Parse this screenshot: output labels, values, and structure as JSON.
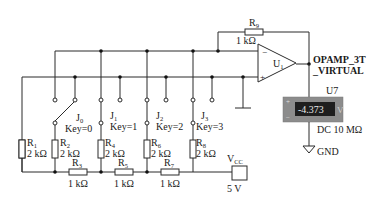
{
  "circuit": {
    "title": "4-bit R-2R ladder D/A converter with op-amp",
    "opamp": {
      "ref": "U",
      "ref_sub": "1",
      "model_line1": "OPAMP_3T",
      "model_line2": "_VIRTUAL",
      "minus": "−",
      "plus": "+"
    },
    "feedback_resistor": {
      "ref": "R",
      "ref_sub": "9",
      "value": "1 kΩ"
    },
    "resistors": [
      {
        "ref": "R",
        "sub": "1",
        "value": "2 kΩ"
      },
      {
        "ref": "R",
        "sub": "2",
        "value": "2 kΩ"
      },
      {
        "ref": "R",
        "sub": "3",
        "value": "1 kΩ"
      },
      {
        "ref": "R",
        "sub": "4",
        "value": "2 kΩ"
      },
      {
        "ref": "R",
        "sub": "5",
        "value": "1 kΩ"
      },
      {
        "ref": "R",
        "sub": "6",
        "value": "2 kΩ"
      },
      {
        "ref": "R",
        "sub": "7",
        "value": "1 kΩ"
      },
      {
        "ref": "R",
        "sub": "8",
        "value": "2 kΩ"
      }
    ],
    "switches": [
      {
        "ref": "J",
        "sub": "0",
        "key": "Key=0"
      },
      {
        "ref": "J",
        "sub": "1",
        "key": "Key=1"
      },
      {
        "ref": "J",
        "sub": "2",
        "key": "Key=2"
      },
      {
        "ref": "J",
        "sub": "3",
        "key": "Key=3"
      }
    ],
    "source": {
      "ref": "V",
      "ref_sub": "CC",
      "value": "5 V"
    },
    "voltmeter": {
      "ref": "U7",
      "reading": "-4.373",
      "unit": "V",
      "mode": "DC  10 MΩ",
      "plus": "+",
      "minus": "−",
      "body_color": "#8c8c8c",
      "display_color": "#1e1e1e"
    },
    "ground": {
      "label": "GND"
    }
  }
}
